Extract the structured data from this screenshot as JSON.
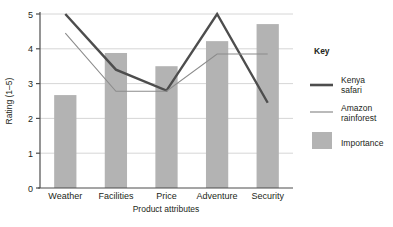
{
  "chart_data": {
    "type": "bar",
    "title": "",
    "xlabel": "Product attributes",
    "ylabel": "Rating (1–5)",
    "categories": [
      "Weather",
      "Facilities",
      "Price",
      "Adventure",
      "Security"
    ],
    "ylim": [
      0,
      5
    ],
    "yticks": [
      "0",
      "1",
      "2",
      "3",
      "4",
      "5"
    ],
    "grid": true,
    "legend_position": "right",
    "series": [
      {
        "name": "Importance",
        "type": "bar",
        "color": "#b3b3b3",
        "values": [
          2.67,
          3.88,
          3.5,
          4.22,
          4.71
        ]
      },
      {
        "name": "Kenya safari",
        "type": "line",
        "color": "#4d4d4d",
        "width": 2.4,
        "values": [
          5.0,
          3.4,
          2.8,
          5.0,
          2.45
        ]
      },
      {
        "name": "Amazon rainforest",
        "type": "line",
        "color": "#8c8c8c",
        "width": 1.1,
        "values": [
          4.45,
          2.78,
          2.78,
          3.85,
          3.85
        ]
      }
    ]
  },
  "axes": {
    "y_title": "Rating (1–5)",
    "x_title": "Product attributes",
    "y_tick_labels": [
      "5",
      "4",
      "3",
      "2",
      "1",
      "0"
    ],
    "x_tick_labels": [
      "Weather",
      "Facilities",
      "Price",
      "Adventure",
      "Security"
    ]
  },
  "legend": {
    "title": "Key",
    "items": [
      {
        "label_line1": "Kenya",
        "label_line2": "safari",
        "marker": "thick-line-swatch"
      },
      {
        "label_line1": "Amazon",
        "label_line2": "rainforest",
        "marker": "thin-line-swatch"
      },
      {
        "label_line1": "Importance",
        "label_line2": "",
        "marker": "bar-swatch"
      }
    ]
  },
  "colors": {
    "bar": "#b3b3b3",
    "kenya": "#4d4d4d",
    "amazon": "#8c8c8c",
    "axis": "#4d4d4d",
    "grid": "#cccccc",
    "background": "#ffffff"
  }
}
